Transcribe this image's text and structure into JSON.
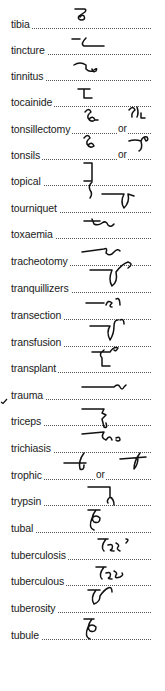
{
  "page": {
    "type": "shorthand-dictionary-column",
    "entries": [
      {
        "term": "tibia",
        "outlines": 1
      },
      {
        "term": "tincture",
        "outlines": 1
      },
      {
        "term": "tinnitus",
        "outlines": 1
      },
      {
        "term": "tocainide",
        "outlines": 1
      },
      {
        "term": "tonsillectomy",
        "outlines": 2,
        "separator": "or"
      },
      {
        "term": "tonsils",
        "outlines": 2,
        "separator": "or"
      },
      {
        "term": "topical",
        "outlines": 1
      },
      {
        "term": "tourniquet",
        "outlines": 1
      },
      {
        "term": "toxaemia",
        "outlines": 1
      },
      {
        "term": "tracheotomy",
        "outlines": 1
      },
      {
        "term": "tranquillizers",
        "outlines": 1
      },
      {
        "term": "transection",
        "outlines": 1
      },
      {
        "term": "transfusion",
        "outlines": 1
      },
      {
        "term": "transplant",
        "outlines": 1
      },
      {
        "term": "trauma",
        "outlines": 1,
        "marked": true
      },
      {
        "term": "triceps",
        "outlines": 1
      },
      {
        "term": "trichiasis",
        "outlines": 1
      },
      {
        "term": "trophic",
        "outlines": 2,
        "separator": "or"
      },
      {
        "term": "trypsin",
        "outlines": 1
      },
      {
        "term": "tubal",
        "outlines": 1
      },
      {
        "term": "tuberculosis",
        "outlines": 1
      },
      {
        "term": "tuberculous",
        "outlines": 1
      },
      {
        "term": "tuberosity",
        "outlines": 1
      },
      {
        "term": "tubule",
        "outlines": 1
      }
    ],
    "separator_label": "or",
    "margin_mark": "check-tick"
  }
}
